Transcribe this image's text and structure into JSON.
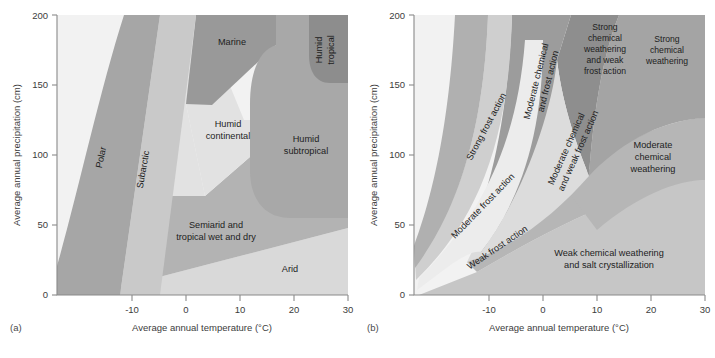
{
  "figure": {
    "panels": [
      {
        "tag": "(a)",
        "title": "Climate regions",
        "xlabel": "Average annual temperature (°C)",
        "ylabel": "Average annual precipitation (cm)",
        "xticks": [
          "-10",
          "0",
          "10",
          "20",
          "30"
        ],
        "yticks": [
          "0",
          "50",
          "100",
          "150",
          "200"
        ],
        "regions": [
          {
            "name": "Polar",
            "label": "Polar",
            "shade": "#a6a6a6"
          },
          {
            "name": "Subarctic",
            "label": "Subarctic",
            "shade": "#c9c9c9"
          },
          {
            "name": "Marine",
            "label": "Marine",
            "shade": "#999999"
          },
          {
            "name": "Humid continental",
            "label": "Humid\ncontinental",
            "shade": "#e2e2e2"
          },
          {
            "name": "Humid subtropical",
            "label": "Humid\nsubtropical",
            "shade": "#a8a8a8"
          },
          {
            "name": "Humid tropical",
            "label": "Humid\ntropical",
            "shade": "#8d8d8d"
          },
          {
            "name": "Semiarid and tropical wet and dry",
            "label": "Semiarid and\ntropical wet and dry",
            "shade": "#b3b3b3"
          },
          {
            "name": "Arid",
            "label": "Arid",
            "shade": "#d9d9d9"
          }
        ]
      },
      {
        "tag": "(b)",
        "title": "Weathering regions",
        "xlabel": "Average annual temperature (°C)",
        "ylabel": "Average annual precipitation (cm)",
        "xticks": [
          "-10",
          "0",
          "10",
          "20",
          "30"
        ],
        "yticks": [
          "0",
          "50",
          "100",
          "150",
          "200"
        ],
        "regions": [
          {
            "name": "Strong frost action",
            "label": "Strong frost action",
            "shade": "#b0b0b0"
          },
          {
            "name": "Moderate frost action",
            "label": "Moderate frost action",
            "shade": "#cfcfcf"
          },
          {
            "name": "Weak frost action",
            "label": "Weak frost action",
            "shade": "#ececec"
          },
          {
            "name": "Moderate chemical and frost action",
            "label": "Moderate chemical\nand frost action",
            "shade": "#9c9c9c"
          },
          {
            "name": "Moderate chemical and weak frost action",
            "label": "Moderate chemical\nand weak frost action",
            "shade": "#dcdcdc"
          },
          {
            "name": "Strong chemical weathering and weak frost action",
            "label": "Strong\nchemical\nweathering\nand weak\nfrost action",
            "shade": "#8e8e8e"
          },
          {
            "name": "Strong chemical weathering",
            "label": "Strong\nchemical\nweathering",
            "shade": "#a4a4a4"
          },
          {
            "name": "Moderate chemical weathering",
            "label": "Moderate\nchemical\nweathering",
            "shade": "#b6b6b6"
          },
          {
            "name": "Weak chemical weathering and salt crystallization",
            "label": "Weak chemical weathering\nand salt crystallization",
            "shade": "#c6c6c6"
          }
        ]
      }
    ],
    "colors": {
      "background": "#ffffff",
      "axis": "#8a8a8a",
      "text": "#1d1d1d",
      "lightest": "#f2f2f2",
      "darkest": "#8d8d8d"
    }
  }
}
